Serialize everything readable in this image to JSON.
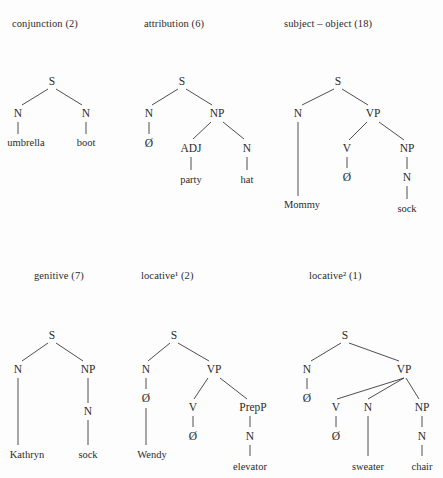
{
  "figure": {
    "background_color": "#fdfdfd",
    "ink_color": "#2b2b2b",
    "line_color": "#3a3a3a",
    "width": 443,
    "height": 478,
    "null_symbol": "Ø"
  },
  "panels": [
    {
      "id": "conjunction",
      "title": "conjunction (2)",
      "title_base": "conjunction",
      "title_sup": "",
      "title_count": "(2)",
      "root": "S",
      "words": [
        "umbrella",
        "boot"
      ],
      "structure": "S -> N(umbrella) N(boot)"
    },
    {
      "id": "attribution",
      "title": "attribution (6)",
      "title_base": "attribution",
      "title_sup": "",
      "title_count": "(6)",
      "root": "S",
      "words": [
        "party",
        "hat"
      ],
      "structure": "S -> N(Ø) NP[ADJ(party) N(hat)]"
    },
    {
      "id": "subject-object",
      "title": "subject – object (18)",
      "title_base": "subject – object",
      "title_sup": "",
      "title_count": "(18)",
      "root": "S",
      "words": [
        "Mommy",
        "sock"
      ],
      "structure": "S -> N(Mommy) VP[V(Ø) NP[N(sock)]]"
    },
    {
      "id": "genitive",
      "title": "genitive (7)",
      "title_base": "genitive",
      "title_sup": "",
      "title_count": "(7)",
      "root": "S",
      "words": [
        "Kathryn",
        "sock"
      ],
      "structure": "S -> N(Kathryn) NP[N(sock)]"
    },
    {
      "id": "locative-1",
      "title": "locative¹ (2)",
      "title_base": "locative",
      "title_sup": "1",
      "title_count": "(2)",
      "root": "S",
      "words": [
        "Wendy",
        "elevator"
      ],
      "structure": "S -> N[Ø(Wendy)] VP[V(Ø) PrepP[N(elevator)]]"
    },
    {
      "id": "locative-2",
      "title": "locative² (1)",
      "title_base": "locative",
      "title_sup": "2",
      "title_count": "(1)",
      "root": "S",
      "words": [
        "sweater",
        "chair"
      ],
      "structure": "S -> N(Ø) VP[V(Ø) N(sweater) NP[N(chair)]]"
    }
  ],
  "labels": {
    "t1_S": "S",
    "t1_N_left": "N",
    "t1_N_right": "N",
    "t1_w_umbrella": "umbrella",
    "t1_w_boot": "boot",
    "t2_S": "S",
    "t2_N": "N",
    "t2_null": "Ø",
    "t2_NP": "NP",
    "t2_ADJ": "ADJ",
    "t2_N2": "N",
    "t2_w_party": "party",
    "t2_w_hat": "hat",
    "t3_S": "S",
    "t3_N": "N",
    "t3_VP": "VP",
    "t3_V": "V",
    "t3_null": "Ø",
    "t3_NP": "NP",
    "t3_N2": "N",
    "t3_w_mommy": "Mommy",
    "t3_w_sock": "sock",
    "t4_S": "S",
    "t4_N": "N",
    "t4_NP": "NP",
    "t4_N2": "N",
    "t4_w_kathryn": "Kathryn",
    "t4_w_sock": "sock",
    "t5_S": "S",
    "t5_N": "N",
    "t5_null": "Ø",
    "t5_VP": "VP",
    "t5_V": "V",
    "t5_vnull": "Ø",
    "t5_PrepP": "PrepP",
    "t5_N2": "N",
    "t5_w_wendy": "Wendy",
    "t5_w_elevator": "elevator",
    "t6_S": "S",
    "t6_N": "N",
    "t6_null": "Ø",
    "t6_VP": "VP",
    "t6_V": "V",
    "t6_vnull": "Ø",
    "t6_N2": "N",
    "t6_NP": "NP",
    "t6_N3": "N",
    "t6_w_sweater": "sweater",
    "t6_w_chair": "chair"
  }
}
